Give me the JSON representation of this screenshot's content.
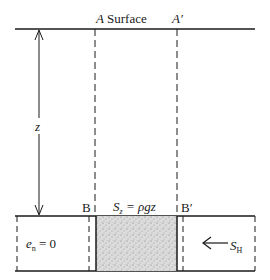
{
  "diagram": {
    "top_labels": {
      "a": "A",
      "surface": "Surface",
      "a_prime": "A′"
    },
    "depth_label": "z",
    "bottom_labels": {
      "b": "B",
      "b_prime": "B′"
    },
    "stress_vertical": {
      "symbol": "S",
      "subscript": "z",
      "equation": "= ρgz"
    },
    "strain_label": {
      "symbol": "e",
      "subscript": "n",
      "equation": "= 0"
    },
    "stress_horizontal": {
      "symbol": "S",
      "subscript": "H"
    },
    "colors": {
      "line": "#1a1a1a",
      "fill": "#d4d4d4"
    }
  }
}
